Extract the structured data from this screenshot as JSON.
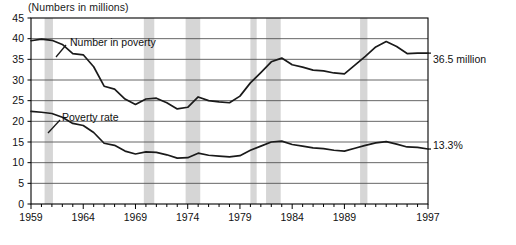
{
  "chart_data": {
    "type": "line",
    "title": "",
    "subtitle": "(Numbers in millions)",
    "xlabel": "",
    "ylabel": "",
    "xlim": [
      1959,
      1997
    ],
    "ylim": [
      0,
      45
    ],
    "grid": true,
    "gridlines_y": [
      5,
      10,
      15,
      20,
      25,
      30,
      35,
      40,
      45
    ],
    "legend_position": "inline",
    "y_ticks": [
      "0",
      "5",
      "10",
      "15",
      "20",
      "25",
      "30",
      "35",
      "40",
      "45"
    ],
    "y_tick_values": [
      0,
      5,
      10,
      15,
      20,
      25,
      30,
      35,
      40,
      45
    ],
    "x_ticks_labeled": [
      "1959",
      "1964",
      "1969",
      "1974",
      "1979",
      "1984",
      "1989",
      "1997"
    ],
    "x_tick_label_values": [
      1959,
      1964,
      1969,
      1974,
      1979,
      1984,
      1989,
      1997
    ],
    "x_minor_ticks": [
      1959,
      1960,
      1961,
      1962,
      1963,
      1964,
      1965,
      1966,
      1967,
      1968,
      1969,
      1970,
      1971,
      1972,
      1973,
      1974,
      1975,
      1976,
      1977,
      1978,
      1979,
      1980,
      1981,
      1982,
      1983,
      1984,
      1985,
      1986,
      1987,
      1988,
      1989,
      1990,
      1991,
      1992,
      1993,
      1994,
      1995,
      1996,
      1997
    ],
    "x": [
      1959,
      1960,
      1961,
      1962,
      1963,
      1964,
      1965,
      1966,
      1967,
      1968,
      1969,
      1970,
      1971,
      1972,
      1973,
      1974,
      1975,
      1976,
      1977,
      1978,
      1979,
      1980,
      1981,
      1982,
      1983,
      1984,
      1985,
      1986,
      1987,
      1988,
      1989,
      1990,
      1991,
      1992,
      1993,
      1994,
      1995,
      1996,
      1997
    ],
    "series": [
      {
        "name": "Number in poverty",
        "units": "millions",
        "label_text": "Number in poverty",
        "end_label": "36.5 million",
        "values": [
          39.5,
          39.9,
          39.6,
          38.6,
          36.4,
          36.1,
          33.2,
          28.5,
          27.8,
          25.4,
          24.1,
          25.4,
          25.6,
          24.5,
          23.0,
          23.4,
          25.9,
          25.0,
          24.7,
          24.5,
          26.1,
          29.3,
          31.8,
          34.4,
          35.3,
          33.7,
          33.1,
          32.4,
          32.2,
          31.7,
          31.5,
          33.6,
          35.7,
          38.0,
          39.3,
          38.1,
          36.4,
          36.5,
          36.5
        ]
      },
      {
        "name": "Poverty rate",
        "units": "percent",
        "label_text": "Poverty rate",
        "end_label": "13.3%",
        "values": [
          22.4,
          22.2,
          21.9,
          21.0,
          19.5,
          19.0,
          17.3,
          14.7,
          14.2,
          12.8,
          12.1,
          12.6,
          12.5,
          11.9,
          11.1,
          11.2,
          12.3,
          11.8,
          11.6,
          11.4,
          11.7,
          13.0,
          14.0,
          15.0,
          15.2,
          14.4,
          14.0,
          13.6,
          13.4,
          13.0,
          12.8,
          13.5,
          14.2,
          14.8,
          15.1,
          14.5,
          13.8,
          13.7,
          13.3
        ]
      }
    ],
    "recession_bands": [
      {
        "start": 1960.3,
        "end": 1961.1
      },
      {
        "start": 1969.8,
        "end": 1970.8
      },
      {
        "start": 1973.8,
        "end": 1975.2
      },
      {
        "start": 1980.0,
        "end": 1980.6
      },
      {
        "start": 1981.5,
        "end": 1982.9
      },
      {
        "start": 1990.5,
        "end": 1991.2
      }
    ],
    "colors": {
      "line": "#1a1a1a",
      "grid": "#555555",
      "axis": "#000000",
      "recession_band": "#d6d6d6",
      "background": "#ffffff"
    }
  }
}
